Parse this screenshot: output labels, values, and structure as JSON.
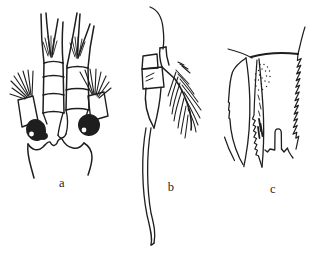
{
  "meta": {
    "background_color": "#ffffff",
    "ink_color": "#1e1e1e",
    "figure_type": "scientific line illustration, three labeled panels"
  },
  "figure": {
    "panels": [
      {
        "id": "panel-a",
        "label": "a"
      },
      {
        "id": "panel-b",
        "label": "b"
      },
      {
        "id": "panel-c",
        "label": "c"
      }
    ]
  }
}
